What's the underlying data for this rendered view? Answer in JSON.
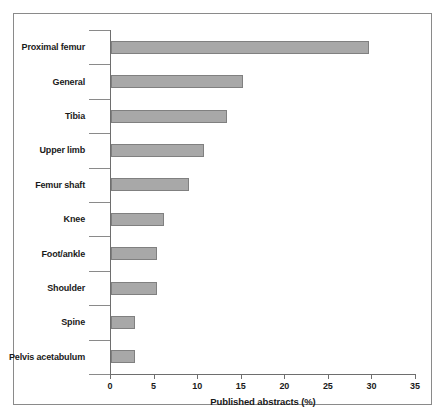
{
  "chart_data": {
    "type": "bar",
    "orientation": "horizontal",
    "title": "",
    "xlabel": "Published abstracts (%)",
    "ylabel": "",
    "xlim": [
      0,
      35
    ],
    "xticks": [
      0,
      5,
      10,
      15,
      20,
      25,
      30,
      35
    ],
    "grid": false,
    "legend": null,
    "categories": [
      "Proximal femur",
      "General",
      "Tibia",
      "Upper limb",
      "Femur shaft",
      "Knee",
      "Foot/ankle",
      "Shoulder",
      "Spine",
      "Pelvis acetabulum"
    ],
    "values": [
      29.6,
      15.2,
      13.3,
      10.7,
      8.9,
      6.1,
      5.3,
      5.3,
      2.7,
      2.7
    ],
    "bar_color": "#a8a8a8",
    "bar_border_color": "#808080",
    "axis_color": "#6e6e6e",
    "text_color": "#1a1a1a",
    "background": "#ffffff"
  }
}
